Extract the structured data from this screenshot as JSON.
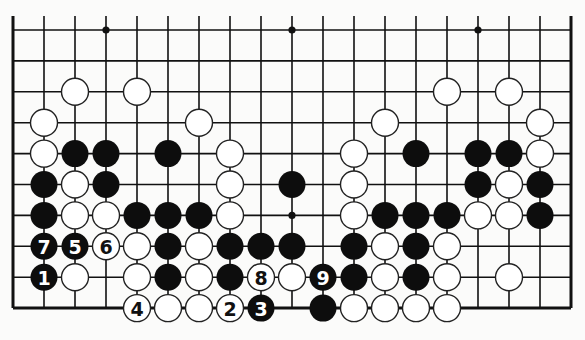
{
  "board": {
    "columns": 19,
    "rows_visible": 10,
    "origin_x": 13,
    "origin_y": 30,
    "spacing_x": 31,
    "spacing_y": 30.9,
    "stone_radius": 13.5,
    "edges": {
      "left": true,
      "right": true,
      "bottom": true,
      "top": false
    },
    "star_points": [
      [
        3,
        0
      ],
      [
        9,
        0
      ],
      [
        15,
        0
      ],
      [
        9,
        6
      ]
    ]
  },
  "stones": [
    {
      "c": 2,
      "r": 2,
      "color": "white"
    },
    {
      "c": 4,
      "r": 2,
      "color": "white"
    },
    {
      "c": 14,
      "r": 2,
      "color": "white"
    },
    {
      "c": 16,
      "r": 2,
      "color": "white"
    },
    {
      "c": 1,
      "r": 3,
      "color": "white"
    },
    {
      "c": 6,
      "r": 3,
      "color": "white"
    },
    {
      "c": 12,
      "r": 3,
      "color": "white"
    },
    {
      "c": 17,
      "r": 3,
      "color": "white"
    },
    {
      "c": 1,
      "r": 4,
      "color": "white"
    },
    {
      "c": 2,
      "r": 4,
      "color": "black"
    },
    {
      "c": 3,
      "r": 4,
      "color": "black"
    },
    {
      "c": 5,
      "r": 4,
      "color": "black"
    },
    {
      "c": 7,
      "r": 4,
      "color": "white"
    },
    {
      "c": 11,
      "r": 4,
      "color": "white"
    },
    {
      "c": 13,
      "r": 4,
      "color": "black"
    },
    {
      "c": 15,
      "r": 4,
      "color": "black"
    },
    {
      "c": 16,
      "r": 4,
      "color": "black"
    },
    {
      "c": 17,
      "r": 4,
      "color": "white"
    },
    {
      "c": 1,
      "r": 5,
      "color": "black"
    },
    {
      "c": 2,
      "r": 5,
      "color": "white"
    },
    {
      "c": 3,
      "r": 5,
      "color": "black"
    },
    {
      "c": 7,
      "r": 5,
      "color": "white"
    },
    {
      "c": 9,
      "r": 5,
      "color": "black"
    },
    {
      "c": 11,
      "r": 5,
      "color": "white"
    },
    {
      "c": 15,
      "r": 5,
      "color": "black"
    },
    {
      "c": 16,
      "r": 5,
      "color": "white"
    },
    {
      "c": 17,
      "r": 5,
      "color": "black"
    },
    {
      "c": 1,
      "r": 6,
      "color": "black"
    },
    {
      "c": 2,
      "r": 6,
      "color": "white"
    },
    {
      "c": 3,
      "r": 6,
      "color": "white"
    },
    {
      "c": 4,
      "r": 6,
      "color": "black"
    },
    {
      "c": 5,
      "r": 6,
      "color": "black"
    },
    {
      "c": 6,
      "r": 6,
      "color": "black"
    },
    {
      "c": 7,
      "r": 6,
      "color": "white"
    },
    {
      "c": 11,
      "r": 6,
      "color": "white"
    },
    {
      "c": 12,
      "r": 6,
      "color": "black"
    },
    {
      "c": 13,
      "r": 6,
      "color": "black"
    },
    {
      "c": 14,
      "r": 6,
      "color": "black"
    },
    {
      "c": 15,
      "r": 6,
      "color": "white"
    },
    {
      "c": 16,
      "r": 6,
      "color": "white"
    },
    {
      "c": 17,
      "r": 6,
      "color": "black"
    },
    {
      "c": 1,
      "r": 7,
      "color": "black",
      "label": "7"
    },
    {
      "c": 2,
      "r": 7,
      "color": "black",
      "label": "5"
    },
    {
      "c": 3,
      "r": 7,
      "color": "white",
      "label": "6"
    },
    {
      "c": 4,
      "r": 7,
      "color": "white"
    },
    {
      "c": 5,
      "r": 7,
      "color": "black"
    },
    {
      "c": 6,
      "r": 7,
      "color": "white"
    },
    {
      "c": 7,
      "r": 7,
      "color": "black"
    },
    {
      "c": 8,
      "r": 7,
      "color": "black"
    },
    {
      "c": 9,
      "r": 7,
      "color": "black"
    },
    {
      "c": 11,
      "r": 7,
      "color": "black"
    },
    {
      "c": 12,
      "r": 7,
      "color": "white"
    },
    {
      "c": 13,
      "r": 7,
      "color": "black"
    },
    {
      "c": 14,
      "r": 7,
      "color": "white"
    },
    {
      "c": 1,
      "r": 8,
      "color": "black",
      "label": "1"
    },
    {
      "c": 2,
      "r": 8,
      "color": "white"
    },
    {
      "c": 4,
      "r": 8,
      "color": "white"
    },
    {
      "c": 5,
      "r": 8,
      "color": "black"
    },
    {
      "c": 6,
      "r": 8,
      "color": "white"
    },
    {
      "c": 7,
      "r": 8,
      "color": "black"
    },
    {
      "c": 8,
      "r": 8,
      "color": "white",
      "label": "8"
    },
    {
      "c": 9,
      "r": 8,
      "color": "white"
    },
    {
      "c": 10,
      "r": 8,
      "color": "black",
      "label": "9"
    },
    {
      "c": 11,
      "r": 8,
      "color": "black"
    },
    {
      "c": 12,
      "r": 8,
      "color": "white"
    },
    {
      "c": 13,
      "r": 8,
      "color": "black"
    },
    {
      "c": 14,
      "r": 8,
      "color": "white"
    },
    {
      "c": 16,
      "r": 8,
      "color": "white"
    },
    {
      "c": 4,
      "r": 9,
      "color": "white",
      "label": "4"
    },
    {
      "c": 5,
      "r": 9,
      "color": "white"
    },
    {
      "c": 6,
      "r": 9,
      "color": "white"
    },
    {
      "c": 7,
      "r": 9,
      "color": "white",
      "label": "2"
    },
    {
      "c": 8,
      "r": 9,
      "color": "black",
      "label": "3"
    },
    {
      "c": 10,
      "r": 9,
      "color": "black"
    },
    {
      "c": 11,
      "r": 9,
      "color": "white"
    },
    {
      "c": 12,
      "r": 9,
      "color": "white"
    },
    {
      "c": 13,
      "r": 9,
      "color": "white"
    },
    {
      "c": 14,
      "r": 9,
      "color": "white"
    }
  ],
  "colors": {
    "background": "#fbfbfa",
    "line": "#111111",
    "black_stone": "#0d0d0d",
    "white_stone": "#ffffff"
  }
}
